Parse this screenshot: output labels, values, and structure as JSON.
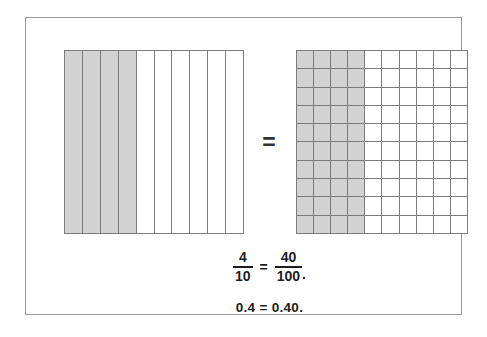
{
  "figure": {
    "frame_border_color": "#9a9a9a",
    "background_color": "#ffffff",
    "shaded_color": "#d2d2d2",
    "grid_line_color": "#7d7d7d",
    "text_color": "#1d1d1d"
  },
  "left_model": {
    "name": "tenths-bar-model",
    "columns": 10,
    "rows": 1,
    "shaded_columns": 4,
    "shaded_count": 4,
    "total_count": 10,
    "fraction_represented": "4/10"
  },
  "right_model": {
    "name": "hundredths-grid-model",
    "columns": 10,
    "rows": 10,
    "shaded_columns": 4,
    "shaded_count": 40,
    "total_count": 100,
    "fraction_represented": "40/100"
  },
  "middle": {
    "equals_symbol": "="
  },
  "equation": {
    "left_fraction": {
      "numerator": "4",
      "denominator": "10"
    },
    "equals": "=",
    "right_fraction": {
      "numerator": "40",
      "denominator": "100"
    },
    "trailing_punctuation": ".",
    "decimal_line": "0.4 = 0.40."
  },
  "chart_data": {
    "type": "bar",
    "categories": [
      "tenths model (shaded of 10)",
      "hundredths model (shaded of 100)"
    ],
    "values": [
      4,
      40
    ],
    "series": [
      {
        "name": "shaded parts",
        "values": [
          4,
          40
        ]
      },
      {
        "name": "total parts",
        "values": [
          10,
          100
        ]
      }
    ],
    "annotations": [
      "4/10 = 40/100.",
      "0.4 = 0.40."
    ],
    "xlabel": "",
    "ylabel": "",
    "ylim": [
      0,
      100
    ]
  }
}
